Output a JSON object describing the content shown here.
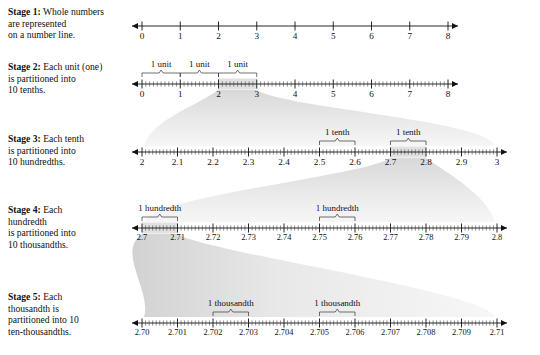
{
  "stages": [
    {
      "id": "stage-1",
      "label": "Stage 1:",
      "text_lines": [
        "Whole numbers",
        "are represented",
        "on a number line."
      ],
      "line": {
        "from": 0,
        "to": 8,
        "tick_labels": [
          "0",
          "1",
          "2",
          "3",
          "4",
          "5",
          "6",
          "7",
          "8"
        ],
        "subdivisions": 1,
        "left_arrow": true,
        "right_arrow": true
      },
      "braces": [],
      "highlight": null
    },
    {
      "id": "stage-2",
      "label": "Stage 2:",
      "text_lines": [
        "Each unit (one)",
        "is partitioned into",
        "10 tenths."
      ],
      "line": {
        "from": 0,
        "to": 8,
        "tick_labels": [
          "0",
          "1",
          "2",
          "3",
          "4",
          "5",
          "6",
          "7",
          "8"
        ],
        "subdivisions": 10,
        "left_arrow": true,
        "right_arrow": true
      },
      "braces": [
        {
          "label": "1 unit",
          "from": 0,
          "to": 1
        },
        {
          "label": "1 unit",
          "from": 1,
          "to": 2
        },
        {
          "label": "1 unit",
          "from": 2,
          "to": 3
        }
      ],
      "highlight": {
        "from": 2,
        "to": 3
      }
    },
    {
      "id": "stage-3",
      "label": "Stage 3:",
      "text_lines": [
        "Each tenth",
        "is partitioned into",
        "10 hundredths."
      ],
      "line": {
        "from": 2,
        "to": 3,
        "tick_labels": [
          "2",
          "2.1",
          "2.2",
          "2.3",
          "2.4",
          "2.5",
          "2.6",
          "2.7",
          "2.8",
          "2.9",
          "3"
        ],
        "subdivisions": 10,
        "left_arrow": true,
        "right_arrow": true
      },
      "braces": [
        {
          "label": "1 tenth",
          "from": 2.5,
          "to": 2.6
        },
        {
          "label": "1 tenth",
          "from": 2.7,
          "to": 2.8
        }
      ],
      "highlight": {
        "from": 2.7,
        "to": 2.8
      }
    },
    {
      "id": "stage-4",
      "label": "Stage 4:",
      "text_lines": [
        "Each",
        "hundredth",
        "is partitioned into",
        "10 thousandths."
      ],
      "line": {
        "from": 2.7,
        "to": 2.8,
        "tick_labels": [
          "2.7",
          "2.71",
          "2.72",
          "2.73",
          "2.74",
          "2.75",
          "2.76",
          "2.77",
          "2.78",
          "2.79",
          "2.8"
        ],
        "subdivisions": 10,
        "left_arrow": true,
        "right_arrow": true
      },
      "braces": [
        {
          "label": "1 hundredth",
          "from": 2.7,
          "to": 2.71
        },
        {
          "label": "1 hundredth",
          "from": 2.75,
          "to": 2.76
        }
      ],
      "highlight": {
        "from": 2.7,
        "to": 2.71
      }
    },
    {
      "id": "stage-5",
      "label": "Stage 5:",
      "text_lines": [
        "Each",
        "thousandth is",
        "partitioned into 10",
        "ten-thousandths."
      ],
      "line": {
        "from": 2.7,
        "to": 2.71,
        "tick_labels": [
          "2.70",
          "2.701",
          "2.702",
          "2.703",
          "2.704",
          "2.705",
          "2.706",
          "2.707",
          "2.708",
          "2.709",
          "2.71"
        ],
        "subdivisions": 10,
        "left_arrow": true,
        "right_arrow": true
      },
      "braces": [
        {
          "label": "1 thousandth",
          "from": 2.702,
          "to": 2.703
        },
        {
          "label": "1 thousandth",
          "from": 2.705,
          "to": 2.706
        }
      ],
      "highlight": null
    }
  ],
  "colors": {
    "ink": "#111111",
    "shade_light": "#f2f2f2",
    "shade_mid": "#e2e2e2",
    "shade_dark": "#cfcfcf",
    "background": "#ffffff"
  }
}
